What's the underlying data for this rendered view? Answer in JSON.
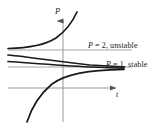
{
  "figure": {
    "title": "",
    "axis_labels": {
      "y": "P",
      "x": "t"
    },
    "annotations": {
      "unstable": {
        "equation": "P",
        "rest": " = 2, unstable"
      },
      "stable": {
        "equation": "P",
        "rest": " = 1, stable"
      }
    },
    "colors": {
      "axis": "#8a8a8a",
      "equilibrium_line": "#8a8a8a",
      "solution_curve": "#1a1a1a",
      "text": "#1a1a1a",
      "background": "#ffffff"
    }
  },
  "chart_data": {
    "type": "line",
    "title": "",
    "xlabel": "t",
    "ylabel": "P",
    "grid": false,
    "legend": "none",
    "axes": {
      "x_axis_pixel_y": 88,
      "y_axis_pixel_x": 63,
      "x_arrow_tip_x": 120,
      "y_arrow_tip_y": 14,
      "x_range_pixels": [
        8,
        120
      ],
      "y_range_pixels": [
        14,
        122
      ]
    },
    "equilibria": [
      {
        "label": "P = 2, unstable",
        "P": 2,
        "stability": "unstable",
        "pixel_y": 50
      },
      {
        "label": "P = 1, stable",
        "P": 1,
        "stability": "stable",
        "pixel_y": 67
      }
    ],
    "series": [
      {
        "name": "solution-above-2-diverging",
        "description": "starts just above P = 2 at left, increases without bound",
        "path": "M 8,48.5 C 30,48 45,45 56,38 C 66,31 72,23 77,12"
      },
      {
        "name": "solution-between-1-and-2-upper",
        "description": "starts just below P = 2, decays toward P = 1",
        "path": "M 8,55 C 30,57 60,62 90,65 C 105,66 115,66.5 124,66.8"
      },
      {
        "name": "solution-between-1-and-2-lower",
        "description": "starts near P = 1.4, decays toward P = 1",
        "path": "M 8,61.5 C 30,63 60,65.5 90,67 C 105,67.6 115,67.9 124,68.1"
      },
      {
        "name": "solution-below-1-rising",
        "description": "starts low at left, rises toward P = 1 from below",
        "path": "M 27,122 C 32,106 40,94 52,84 C 66,74 88,70 124,69.4"
      }
    ]
  }
}
